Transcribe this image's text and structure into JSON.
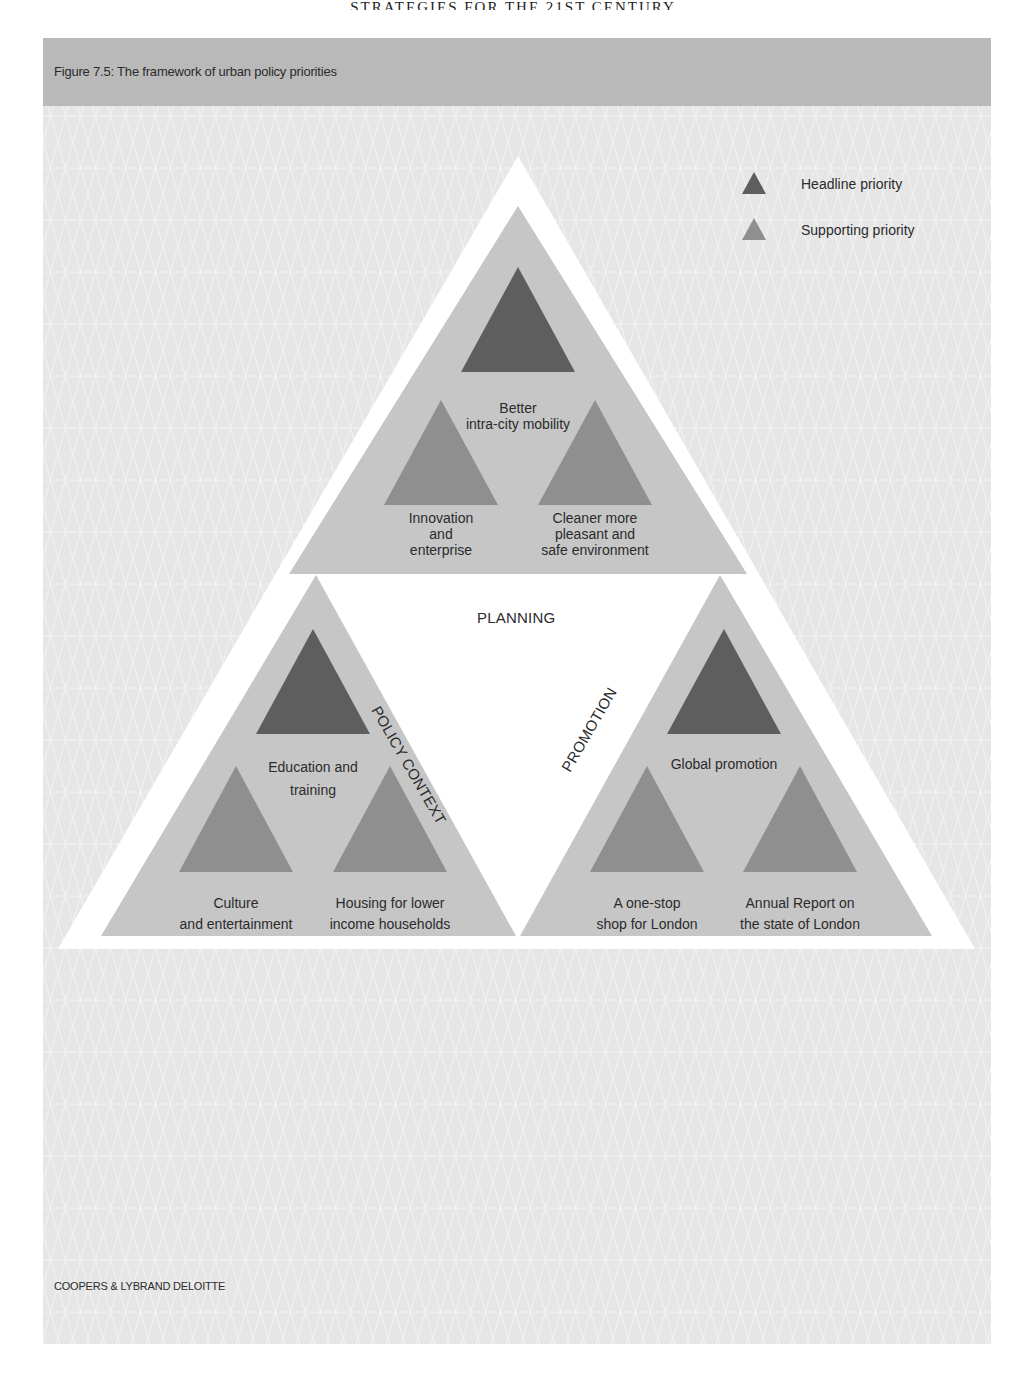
{
  "page": {
    "running_head": "STRATEGIES FOR THE 21ST CENTURY",
    "figure_title": "Figure 7.5: The framework of urban policy priorities",
    "footer": "COOPERS & LYBRAND DELOITTE"
  },
  "colors": {
    "panel_background": "#e6e6e6",
    "title_bar": "#b9b9b9",
    "outer_triangle": "#ffffff",
    "sub_triangle": "#c6c6c6",
    "headline_priority": "#5e5e5e",
    "supporting_priority": "#8f8f8f"
  },
  "legend": {
    "items": [
      {
        "label": "Headline priority",
        "type": "headline",
        "icon": "dark-triangle-icon"
      },
      {
        "label": "Supporting priority",
        "type": "supporting",
        "icon": "light-triangle-icon"
      }
    ]
  },
  "diagram": {
    "center_labels": {
      "top": "PLANNING",
      "left": "POLICY CONTEXT",
      "right": "PROMOTION"
    },
    "groups": {
      "top": {
        "headline": {
          "line1": "Better",
          "line2": "intra-city mobility"
        },
        "supporting_left": {
          "line1": "Innovation",
          "line2": "and",
          "line3": "enterprise"
        },
        "supporting_right": {
          "line1": "Cleaner more",
          "line2": "pleasant and",
          "line3": "safe environment"
        }
      },
      "left": {
        "headline": {
          "line1": "Education and",
          "line2": "training"
        },
        "supporting_left": {
          "line1": "Culture",
          "line2": "and entertainment"
        },
        "supporting_right": {
          "line1": "Housing for lower",
          "line2": "income households"
        }
      },
      "right": {
        "headline": {
          "line1": "Global promotion"
        },
        "supporting_left": {
          "line1": "A one-stop",
          "line2": "shop for London"
        },
        "supporting_right": {
          "line1": "Annual Report on",
          "line2": "the state of London"
        }
      }
    }
  }
}
